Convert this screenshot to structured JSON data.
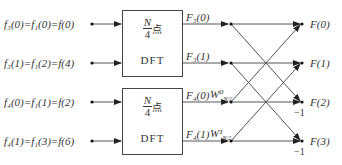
{
  "inputs": [
    {
      "text": "f₃(0)=f₁(0)=f(0)"
    },
    {
      "text": "f₃(1)=f₁(2)=f(4)"
    },
    {
      "text": "f₄(0)=f₁(1)=f(2)"
    },
    {
      "text": "f₄(1)=f₁(3)=f(6)"
    }
  ],
  "blocks": [
    {
      "num": "N",
      "den": "4",
      "suffix": "点",
      "label": "DFT",
      "outputs": [
        "F₃(0)",
        "F₃(1)"
      ]
    },
    {
      "num": "N",
      "den": "4",
      "suffix": "点",
      "label": "DFT",
      "outputs": [
        "F₄(0)",
        "F₄(1)"
      ]
    }
  ],
  "twiddles": [
    "W⁰",
    "W¹"
  ],
  "twiddle_sub": "N/2",
  "outputs": [
    "F(0)",
    "F(1)",
    "F(2)",
    "F(3)"
  ],
  "minus_one": "−1"
}
